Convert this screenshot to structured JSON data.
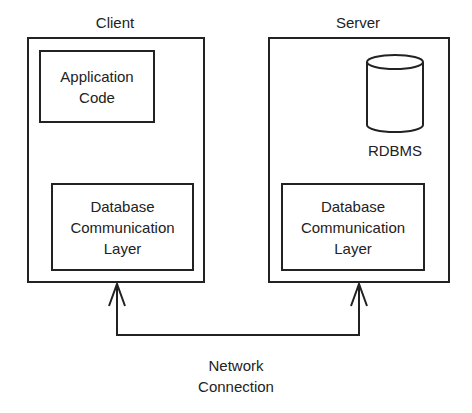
{
  "client": {
    "title": "Client",
    "app_code": [
      "Application",
      "Code"
    ],
    "db_layer": [
      "Database",
      "Communication",
      "Layer"
    ]
  },
  "server": {
    "title": "Server",
    "rdbms": "RDBMS",
    "db_layer": [
      "Database",
      "Communication",
      "Layer"
    ]
  },
  "connection": {
    "label": [
      "Network",
      "Connection"
    ]
  }
}
